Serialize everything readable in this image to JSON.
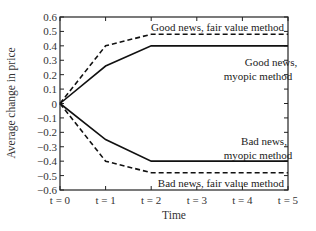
{
  "chart_data": {
    "type": "line",
    "title": "",
    "xlabel": "Time",
    "ylabel": "Average change in price",
    "x": [
      0,
      1,
      2,
      3,
      4,
      5
    ],
    "x_tick_labels": [
      "t = 0",
      "t = 1",
      "t = 2",
      "t = 3",
      "t = 4",
      "t = 5"
    ],
    "ylim": [
      -0.6,
      0.6
    ],
    "y_ticks": [
      0.6,
      0.5,
      0.4,
      0.3,
      0.2,
      0.1,
      0,
      -0.1,
      -0.2,
      -0.3,
      -0.4,
      -0.5,
      -0.6
    ],
    "y_tick_labels": [
      "0.6",
      "0.5",
      "0.4",
      "0.3",
      "0.2",
      "0.1",
      "0",
      "−0.1",
      "−0.2",
      "−0.3",
      "−0.4",
      "−0.5",
      "−0.6"
    ],
    "grid": false,
    "legend": "none (inline annotations)",
    "series": [
      {
        "name": "Good news, fair value method",
        "style": "dashed",
        "values": [
          0,
          0.4,
          0.48,
          0.48,
          0.48,
          0.48
        ]
      },
      {
        "name": "Good news, myopic method",
        "style": "solid",
        "values": [
          0,
          0.26,
          0.4,
          0.4,
          0.4,
          0.4
        ]
      },
      {
        "name": "Bad news, myopic method",
        "style": "solid",
        "values": [
          0,
          -0.25,
          -0.4,
          -0.4,
          -0.4,
          -0.4
        ]
      },
      {
        "name": "Bad news, fair value method",
        "style": "dashed",
        "values": [
          0,
          -0.4,
          -0.48,
          -0.48,
          -0.48,
          -0.48
        ]
      }
    ],
    "annotations": [
      {
        "text": "Good news, fair value method",
        "lines": [
          "Good news, fair value method"
        ]
      },
      {
        "text": "Good news, myopic method",
        "lines": [
          "Good news,",
          "myopic method"
        ]
      },
      {
        "text": "Bad news, myopic method",
        "lines": [
          "Bad news,",
          "myopic method"
        ]
      },
      {
        "text": "Bad news, fair value method",
        "lines": [
          "Bad news, fair value method"
        ]
      }
    ]
  }
}
